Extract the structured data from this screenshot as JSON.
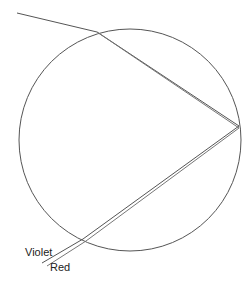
{
  "diagram": {
    "title": "",
    "drop": {
      "cx": 130,
      "cy": 140,
      "r": 111,
      "stroke": "#555555"
    },
    "incoming_ray": {
      "x1": 17,
      "y1": 13,
      "x2": 97,
      "y2": 32
    },
    "reflection_point": {
      "x": 239,
      "y": 126
    },
    "exit_point": {
      "x": 84,
      "y": 240
    },
    "labels": {
      "violet": "Violet",
      "red": "Red"
    },
    "ray_color": "#555555"
  }
}
